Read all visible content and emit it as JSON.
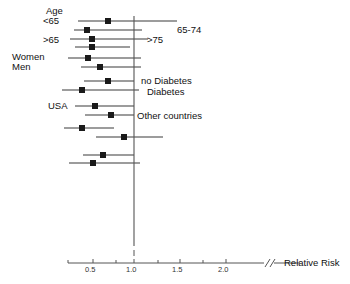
{
  "figure": {
    "type": "forest-plot",
    "background": "#ffffff",
    "line_color": "#3b3b3b",
    "marker_color": "#1a1a1a",
    "axis_color": "#555555"
  },
  "axis": {
    "title": "Relative Risk",
    "title_x": 284,
    "title_y": 258,
    "y": 263,
    "x_start": 68,
    "x_end": 300,
    "break_x": 268,
    "null_value": 1.0,
    "null_line_x": 134,
    "null_line_top": 16,
    "null_line_bottom": 272,
    "px_per_unit": 92,
    "ticks": [
      {
        "value": 0.5,
        "label": "0.5",
        "x": 93,
        "major": true
      },
      {
        "value": 0.75,
        "label": "",
        "x": 116,
        "major": false
      },
      {
        "value": 1.0,
        "label": "1.0",
        "x": 134,
        "major": true
      },
      {
        "value": 1.25,
        "label": "",
        "x": 158,
        "major": false
      },
      {
        "value": 1.5,
        "label": "1.5",
        "x": 180,
        "major": true
      },
      {
        "value": 1.75,
        "label": "",
        "x": 203,
        "major": false
      },
      {
        "value": 2.0,
        "label": "2.0",
        "x": 226,
        "major": true
      }
    ]
  },
  "group_labels": [
    {
      "text": "Age",
      "x": 46,
      "y": 6,
      "name": "group-label-age"
    },
    {
      "text": "<65",
      "x": 43,
      "y": 16,
      "name": "group-label-under65"
    },
    {
      "text": "65-74",
      "x": 177,
      "y": 25,
      "name": "group-label-65-74"
    },
    {
      "text": ">65",
      "x": 43,
      "y": 35,
      "name": "group-label-over65"
    },
    {
      "text": ">75",
      "x": 147,
      "y": 35,
      "name": "group-label-over75"
    },
    {
      "text": "Women",
      "x": 12,
      "y": 52,
      "name": "group-label-women"
    },
    {
      "text": "Men",
      "x": 12,
      "y": 62,
      "name": "group-label-men"
    },
    {
      "text": "no Diabetes",
      "x": 141,
      "y": 76,
      "name": "group-label-no-diabetes"
    },
    {
      "text": "Diabetes",
      "x": 147,
      "y": 87,
      "name": "group-label-diabetes"
    },
    {
      "text": "USA",
      "x": 48,
      "y": 101,
      "name": "group-label-usa"
    },
    {
      "text": "Other countries",
      "x": 137,
      "y": 111,
      "name": "group-label-other-countries"
    }
  ],
  "chart_data": {
    "type": "forest",
    "title": "",
    "xlabel": "Relative Risk",
    "ylabel": "",
    "xlim": [
      0.28,
      2.25
    ],
    "reference_line": 1.0,
    "xscale": "linear",
    "grid": false,
    "legend": "none",
    "xticks": [
      0.5,
      1.0,
      1.5,
      2.0
    ],
    "xticklabels": [
      "0.5",
      "1.0",
      "1.5",
      "2.0"
    ],
    "rows": [
      {
        "label": "<65",
        "y": 21,
        "estimate": 0.72,
        "lower": 0.39,
        "upper": 1.47,
        "marker_x": 108,
        "line_start": 78,
        "line_end": 177
      },
      {
        "label": "65-74",
        "y": 30,
        "estimate": 0.51,
        "lower": 0.36,
        "upper": 1.09,
        "marker_x": 87,
        "line_start": 74,
        "line_end": 142
      },
      {
        "label": "",
        "y": 39,
        "estimate": 0.57,
        "lower": 0.33,
        "upper": 1.16,
        "marker_x": 92,
        "line_start": 70,
        "line_end": 148
      },
      {
        "label": ">65 / >75",
        "y": 47,
        "estimate": 0.57,
        "lower": 0.36,
        "upper": 0.97,
        "marker_x": 92,
        "line_start": 75,
        "line_end": 130
      },
      {
        "label": "Women",
        "y": 58,
        "estimate": 0.53,
        "lower": 0.31,
        "upper": 1.08,
        "marker_x": 88,
        "line_start": 68,
        "line_end": 141
      },
      {
        "label": "Men",
        "y": 67,
        "estimate": 0.65,
        "lower": 0.41,
        "upper": 1.08,
        "marker_x": 100,
        "line_start": 81,
        "line_end": 141
      },
      {
        "label": "no Diabetes",
        "y": 81,
        "estimate": 0.72,
        "lower": 0.44,
        "upper": 1.0,
        "marker_x": 108,
        "line_start": 84,
        "line_end": 134
      },
      {
        "label": "Diabetes",
        "y": 90,
        "estimate": 0.47,
        "lower": 0.21,
        "upper": 1.05,
        "marker_x": 82,
        "line_start": 62,
        "line_end": 139
      },
      {
        "label": "USA",
        "y": 106,
        "estimate": 0.6,
        "lower": 0.36,
        "upper": 1.0,
        "marker_x": 95,
        "line_start": 75,
        "line_end": 134
      },
      {
        "label": "Other countries",
        "y": 115,
        "estimate": 0.73,
        "lower": 0.45,
        "upper": 1.0,
        "marker_x": 111,
        "line_start": 85,
        "line_end": 134
      },
      {
        "label": "",
        "y": 128,
        "estimate": 0.48,
        "lower": 0.29,
        "upper": 0.81,
        "marker_x": 82,
        "line_start": 64,
        "line_end": 114
      },
      {
        "label": "",
        "y": 137,
        "estimate": 0.83,
        "lower": 0.52,
        "upper": 1.32,
        "marker_x": 124,
        "line_start": 96,
        "line_end": 163
      },
      {
        "label": "",
        "y": 155,
        "estimate": 0.66,
        "lower": 0.42,
        "upper": 0.99,
        "marker_x": 103,
        "line_start": 83,
        "line_end": 134
      },
      {
        "label": "",
        "y": 163,
        "estimate": 0.59,
        "lower": 0.31,
        "upper": 1.06,
        "marker_x": 93,
        "line_start": 69,
        "line_end": 140
      }
    ]
  },
  "footer": {
    "caption": ""
  }
}
